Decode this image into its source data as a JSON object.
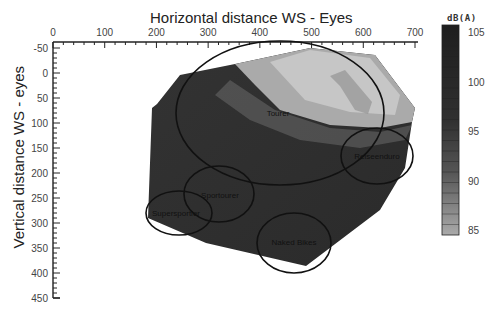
{
  "chart_data": {
    "type": "heatmap",
    "title": "Horizontal distance WS - Eyes",
    "xlabel": "Horizontal distance WS - Eyes",
    "ylabel": "Vertical distance WS - eyes",
    "x_ticks": [
      "0",
      "100",
      "200",
      "300",
      "400",
      "500",
      "600",
      "700"
    ],
    "y_ticks": [
      "-50",
      "0",
      "50",
      "100",
      "150",
      "200",
      "250",
      "300",
      "350",
      "400",
      "450"
    ],
    "xlim": [
      0,
      700
    ],
    "ylim": [
      -50,
      450
    ],
    "x_axis_position": "top",
    "y_axis_inverted": true,
    "colorbar": {
      "label": "dB(A)",
      "ticks": [
        "105",
        "100",
        "95",
        "90",
        "85"
      ],
      "range": [
        85,
        105
      ],
      "colormap": "grayscale (dark = loud, light = quiet)"
    },
    "regions": [
      {
        "name": "Tourer",
        "center": [
          475,
          110
        ],
        "note": "large ellipse, mostly light (~86-92 dB(A)) in upper-right, dark lower-left"
      },
      {
        "name": "Reiseenduro",
        "center": [
          680,
          180
        ],
        "note": "ellipse on right edge, ~95-100 dB(A)"
      },
      {
        "name": "Sportourer",
        "center": [
          320,
          250
        ],
        "note": "dark region ~103 dB(A)"
      },
      {
        "name": "Supersportler",
        "center": [
          220,
          280
        ],
        "note": "dark region ~104 dB(A)"
      },
      {
        "name": "Naked Bikes",
        "center": [
          530,
          370
        ],
        "note": "dark region ~103 dB(A)"
      }
    ],
    "grid": false,
    "legend_position": "right"
  },
  "labels": {
    "title": "Horizontal distance WS - Eyes",
    "ylabel": "Vertical distance WS - eyes",
    "unit": "dB(A)",
    "tourer": "Tourer",
    "reiseenduro": "Reiseenduro",
    "sportourer": "Sportourer",
    "supersportler": "Supersportler",
    "naked": "Naked Bikes"
  },
  "colors": {
    "dark": "#2b2b2b",
    "light": "#c4c4c4",
    "axis": "#222222"
  }
}
